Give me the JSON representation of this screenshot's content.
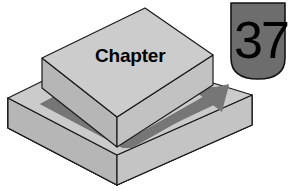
{
  "illustration": {
    "title_word": "Chapter",
    "chapter_number": "37",
    "colors": {
      "page_background": "#ffffff",
      "slab_top_face": "#c9c9c9",
      "slab_front_face": "#b9b9b9",
      "slab_side_face": "#bdbdbd",
      "slab_outline": "#1a1a1a",
      "arrow_fill": "#6f6f6f",
      "badge_fill": "#6b6b6b",
      "badge_outline": "#161616",
      "text_color": "#000000"
    },
    "geometry": {
      "upper_block": {
        "top_face": "145,8 213,55 117,117 42,58",
        "left_face": "42,58 117,117 117,147 42,88",
        "right_face": "117,117 213,55 213,85 117,147"
      },
      "lower_slab": {
        "top_face": "106,50 252,95 117,185 8,98",
        "left_face": "8,98 117,185 117,185 8,128",
        "right_face": "117,185 252,95 252,125 117,185"
      },
      "arrow": {
        "tail_start": [
          40,
          104
        ],
        "elbow": [
          118,
          148
        ],
        "head_tip": [
          225,
          88
        ]
      },
      "badge": {
        "x": 231,
        "y": 2,
        "width": 54,
        "height": 78
      }
    },
    "labels": {
      "word_position": [
        95,
        62
      ],
      "number_position": [
        234,
        58
      ]
    }
  }
}
